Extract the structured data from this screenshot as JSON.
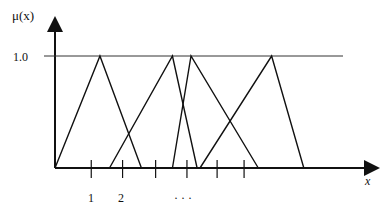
{
  "diagram": {
    "y_axis_label": "μ(x)",
    "x_axis_label": "x",
    "y_level_label": "1.0",
    "y_level_value": 1.0,
    "tick_labels": [
      "1",
      "2"
    ],
    "ellipsis": "· · ·",
    "tick_count": 6,
    "membership_functions": [
      {
        "name": "A1",
        "left": 0.0,
        "peak": 0.155,
        "right": 0.298
      },
      {
        "name": "A2",
        "left": 0.188,
        "peak": 0.405,
        "right": 0.49
      },
      {
        "name": "A3",
        "left": 0.405,
        "peak": 0.469,
        "right": 0.701
      },
      {
        "name": "A4",
        "left": 0.5,
        "peak": 0.747,
        "right": 0.858
      }
    ],
    "tick_positions": [
      0.125,
      0.233,
      0.347,
      0.455,
      0.559,
      0.652
    ]
  }
}
